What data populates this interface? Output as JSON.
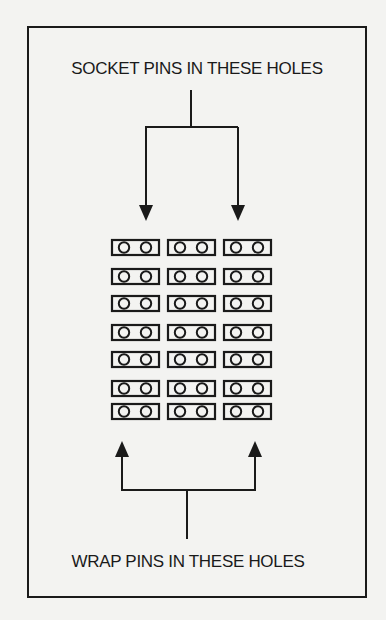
{
  "diagram": {
    "top_label": "SOCKET PINS IN THESE HOLES",
    "bottom_label": "WRAP PINS IN THESE HOLES",
    "pin_grid": {
      "columns": 3,
      "rows": 7,
      "holes_per_block": 2
    },
    "colors": {
      "ink": "#1a1a1a",
      "paper": "#f3f3f1"
    }
  }
}
